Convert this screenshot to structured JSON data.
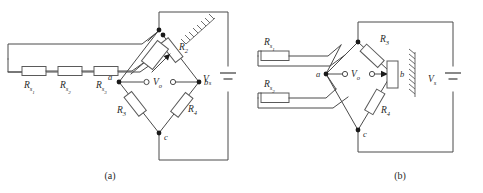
{
  "figure": {
    "type": "circuit-diagram",
    "captions": {
      "panel_a": "(a)",
      "panel_b": "(b)"
    }
  },
  "panel_a": {
    "caption": "(a)",
    "gauge_resistors": [
      {
        "base": "R",
        "sub": "s",
        "subsub": "1"
      },
      {
        "base": "R",
        "sub": "s",
        "subsub": "2"
      },
      {
        "base": "R",
        "sub": "s",
        "subsub": "3"
      }
    ],
    "bridge_resistors": [
      {
        "base": "R",
        "sub": "2",
        "position": "top-right"
      },
      {
        "base": "R",
        "sub": "3",
        "position": "bottom-left"
      },
      {
        "base": "R",
        "sub": "4",
        "position": "bottom-right"
      }
    ],
    "nodes": [
      {
        "label": "a",
        "position": "left"
      },
      {
        "label": "b",
        "position": "right"
      },
      {
        "label": "c",
        "position": "bottom"
      }
    ],
    "output": {
      "base": "V",
      "sub": "o"
    },
    "source": {
      "base": "V",
      "sub": "s"
    }
  },
  "panel_b": {
    "caption": "(b)",
    "gauge_resistors": [
      {
        "base": "R",
        "sub": "s",
        "subsub": "1"
      },
      {
        "base": "R",
        "sub": "s",
        "subsub": "2"
      }
    ],
    "bridge_resistors": [
      {
        "base": "R",
        "sub": "3",
        "position": "top-right"
      },
      {
        "base": "R",
        "sub": "4",
        "position": "bottom-right"
      }
    ],
    "nodes": [
      {
        "label": "a",
        "position": "left"
      },
      {
        "label": "b",
        "position": "right"
      },
      {
        "label": "c",
        "position": "bottom"
      }
    ],
    "output": {
      "base": "V",
      "sub": "o"
    },
    "source": {
      "base": "V",
      "sub": "s"
    }
  },
  "colors": {
    "wire": "#4a4a4a",
    "resistor_stroke": "#5a5a5a",
    "resistor_fill": "#ffffff",
    "node": "#1a1a1a",
    "text": "#2a2a2a",
    "background": "#ffffff"
  }
}
